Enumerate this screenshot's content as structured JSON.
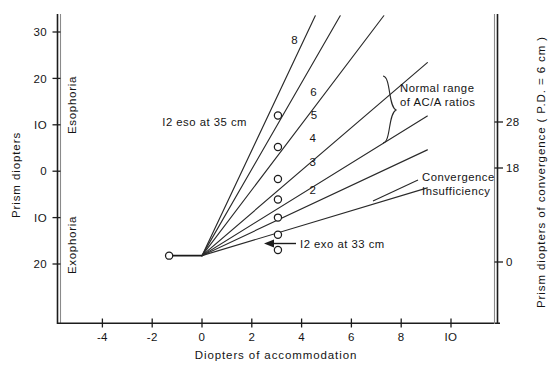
{
  "chart_data": {
    "type": "line",
    "title": "",
    "xlabel": "Diopters of accommodation",
    "ylabel": "Prism diopters",
    "ylabel_right": "Prism diopters of convergence (P.D. = 6 cm )",
    "xlim": [
      -5.6,
      11.8
    ],
    "ylim_phoria": [
      -22.5,
      33.5
    ],
    "grid": false,
    "legend_position": "inline-labels",
    "x_ticks": [
      -4,
      -2,
      0,
      2,
      4,
      6,
      8,
      10
    ],
    "x_tick_labels": [
      "-4",
      "-2",
      "0",
      "2",
      "4",
      "6",
      "8",
      "IO"
    ],
    "y_ticks_left": [
      30,
      20,
      10,
      0,
      -10,
      -20
    ],
    "y_tick_labels_left": [
      "30",
      "20",
      "IO",
      "0",
      "IO",
      "20"
    ],
    "y_ticks_right_values": [
      28,
      18,
      0
    ],
    "y_tick_labels_right": [
      "28",
      "18",
      "0"
    ],
    "y_axis_regions": [
      "Esophoria",
      "Exophoria"
    ],
    "fan_origin": {
      "x": 0,
      "y": -18.2
    },
    "base_segment": {
      "x0": -1.32,
      "y0": -18.2,
      "x1": 0,
      "y1": -18.2
    },
    "base_marker": {
      "x": -1.32,
      "y": -18.2
    },
    "series": [
      {
        "name": "10",
        "acA_ratio": 10,
        "label": "",
        "label_x": null,
        "label_y": null,
        "marker": {
          "x": 3.05,
          "y": 12.0
        },
        "end": {
          "x": 4.55,
          "y": 33.5
        }
      },
      {
        "name": "8",
        "acA_ratio": 8,
        "label": "8",
        "label_x": 3.72,
        "label_y": 27.4,
        "marker": {
          "x": 3.05,
          "y": 5.2
        },
        "end": {
          "x": 5.55,
          "y": 33.5
        }
      },
      {
        "name": "6",
        "acA_ratio": 6,
        "label": "6",
        "label_x": 4.48,
        "label_y": 16.2,
        "marker": {
          "x": 3.05,
          "y": -1.7
        },
        "end": {
          "x": 7.3,
          "y": 33.5
        }
      },
      {
        "name": "5",
        "acA_ratio": 5,
        "label": "5",
        "label_x": 4.5,
        "label_y": 11.2,
        "marker": {
          "x": 3.05,
          "y": -6.1
        },
        "end": {
          "x": 9.05,
          "y": 23.4
        }
      },
      {
        "name": "4",
        "acA_ratio": 4,
        "label": "4",
        "label_x": 4.45,
        "label_y": 6.3,
        "marker": {
          "x": 3.05,
          "y": -10.0
        },
        "end": {
          "x": 9.05,
          "y": 11.9
        }
      },
      {
        "name": "3",
        "acA_ratio": 3,
        "label": "3",
        "label_x": 4.45,
        "label_y": 1.2,
        "marker": {
          "x": 3.05,
          "y": -13.7
        },
        "end": {
          "x": 9.05,
          "y": 4.6
        }
      },
      {
        "name": "2",
        "acA_ratio": 2,
        "label": "2",
        "label_x": 4.45,
        "label_y": -5.0,
        "marker": {
          "x": 3.05,
          "y": -17.0
        },
        "end": {
          "x": 9.05,
          "y": -3.6
        }
      }
    ],
    "annotations": [
      {
        "id": "eso-note",
        "text": "I2  eso  at  35 cm",
        "x": 1.75,
        "y": 12.1,
        "anchor": "end"
      },
      {
        "id": "exo-note",
        "text": "I2  exo  at  33 cm",
        "x": 4.55,
        "y": -17.3,
        "anchor": "start"
      },
      {
        "id": "normal-range",
        "line1": "Normal  range",
        "line2": "of AC/A ratios",
        "x": 9.85,
        "y": 17.2
      },
      {
        "id": "convergence-insufficiency",
        "line1": "Convergence",
        "line2": "Insufficiency",
        "x": 9.55,
        "y": 1.0
      }
    ]
  },
  "figure": {
    "x_axis_title": "Diopters of accommodation",
    "y_axis_title_left": "Prism diopters",
    "y_axis_title_right": "Prism diopters of convergence ( P.D. = 6 cm )",
    "region_top": "Esophoria",
    "region_bottom": "Exophoria"
  }
}
